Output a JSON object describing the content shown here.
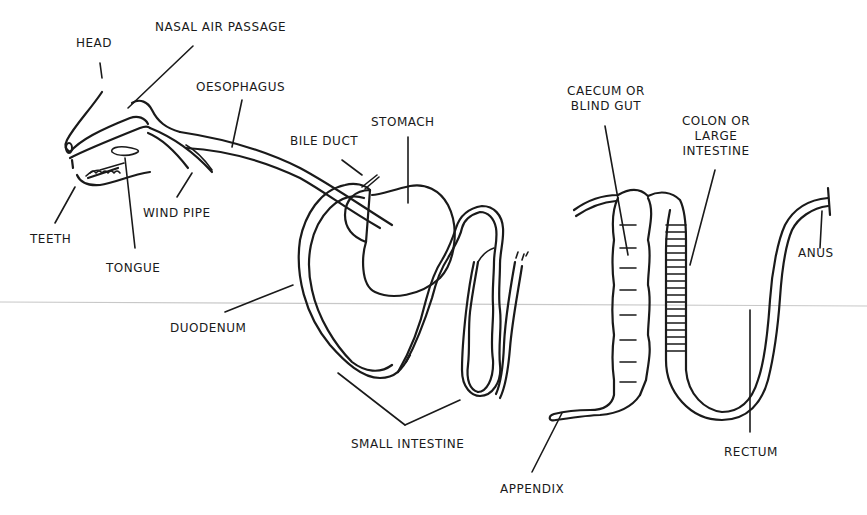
{
  "diagram": {
    "labels": {
      "head": "HEAD",
      "nasal_air_passage": "NASAL AIR PASSAGE",
      "oesophagus": "OESOPHAGUS",
      "bile_duct": "BILE DUCT",
      "stomach": "STOMACH",
      "caecum_line1": "CAECUM OR",
      "caecum_line2": "BLIND GUT",
      "colon_line1": "COLON OR",
      "colon_line2": "LARGE",
      "colon_line3": "INTESTINE",
      "teeth": "TEETH",
      "tongue": "TONGUE",
      "wind_pipe": "WIND PIPE",
      "duodenum": "DUODENUM",
      "small_intestine": "SMALL INTESTINE",
      "appendix": "APPENDIX",
      "rectum": "RECTUM",
      "anus": "ANUS"
    },
    "colors": {
      "ink": "#1a1a1a",
      "background": "#ffffff"
    }
  }
}
